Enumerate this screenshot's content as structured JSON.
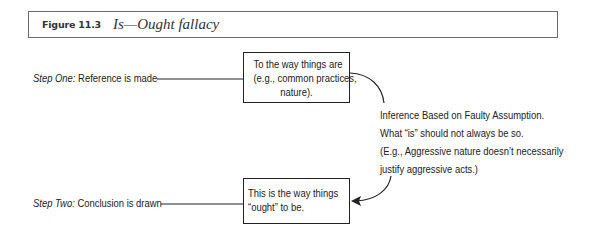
{
  "figure": {
    "label": "Figure 11.3",
    "title": "Is—Ought fallacy"
  },
  "steps": [
    {
      "prefix": "Step One:",
      "text": " Reference is made"
    },
    {
      "prefix": "Step Two:",
      "text": " Conclusion is drawn"
    }
  ],
  "boxes": [
    {
      "lines": [
        "To the way things are",
        "(e.g., common practices,",
        "nature)."
      ]
    },
    {
      "lines": [
        "This is the way things",
        "“ought” to be."
      ]
    }
  ],
  "inference_note": {
    "lines": [
      "Inference Based on Faulty Assumption.",
      "What “is” should not always be so.",
      "(E.g., Aggressive nature doesn’t necessarily",
      "justify aggressive acts.)"
    ]
  },
  "colors": {
    "line": "#222222",
    "header_border": "#6a6a6a",
    "background": "#ffffff"
  }
}
